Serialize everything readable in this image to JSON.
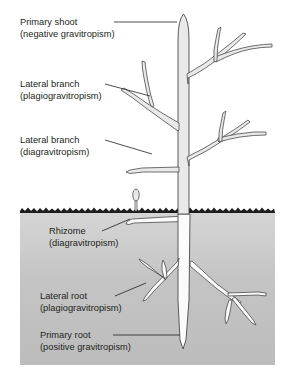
{
  "figure": {
    "background_color": "#ffffff",
    "soil": {
      "name": "soil-block",
      "surface_color": "#1a1a1a",
      "fill_top_color": "#d4d4d4",
      "fill_bottom_color": "#b9b9b9"
    },
    "plant": {
      "shoot_fill": "#e9e9e9",
      "root_fill": "#fbfbfb",
      "outline_color": "#4a4a4a"
    }
  },
  "labels": [
    {
      "id": "primary-shoot",
      "line1": "Primary shoot",
      "line2": "(negative gravitropism)"
    },
    {
      "id": "lateral-branch-plagio",
      "line1": "Lateral branch",
      "line2": "(plagiogravitropism)"
    },
    {
      "id": "lateral-branch-dia",
      "line1": "Lateral branch",
      "line2": "(diagravitropism)"
    },
    {
      "id": "rhizome",
      "line1": "Rhizome",
      "line2": "(diagravitropism)"
    },
    {
      "id": "lateral-root",
      "line1": "Lateral root",
      "line2": "(plagiogravitropism)"
    },
    {
      "id": "primary-root",
      "line1": "Primary root",
      "line2": "(positive gravitropism)"
    }
  ]
}
